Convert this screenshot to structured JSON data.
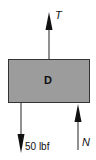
{
  "diagram": {
    "type": "free-body-diagram",
    "body": {
      "label": "D",
      "fill": "#9c9c9c",
      "stroke": "#333333"
    },
    "forces": [
      {
        "id": "tension",
        "label": "T",
        "direction": "up",
        "position": "top-center"
      },
      {
        "id": "weight",
        "label": "50 lbf",
        "direction": "down",
        "position": "bottom-left"
      },
      {
        "id": "normal",
        "label": "N",
        "direction": "up",
        "position": "bottom-right"
      }
    ]
  }
}
